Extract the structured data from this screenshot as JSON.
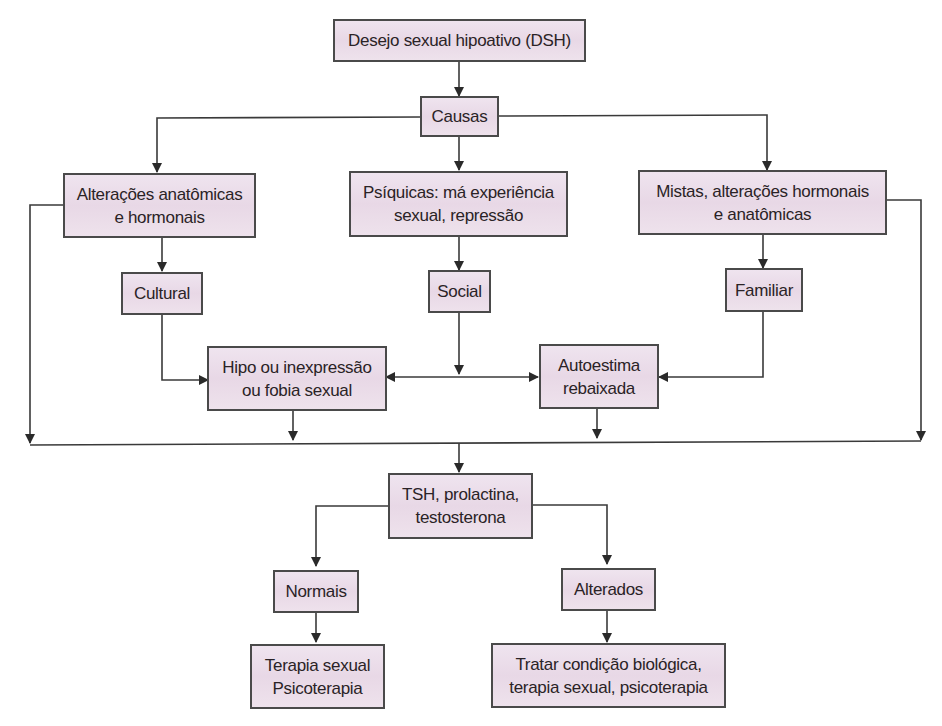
{
  "diagram": {
    "title": "Desejo sexual hipoativo (DSH)",
    "colors": {
      "node_fill": "#ebdde9",
      "node_border": "#4a4a4a",
      "edge": "#3a3a3a",
      "text": "#2a2326"
    },
    "nodes": {
      "dsh": {
        "lines": [
          "Desejo sexual hipoativo (DSH)"
        ]
      },
      "causas": {
        "lines": [
          "Causas"
        ]
      },
      "anatomicas": {
        "lines": [
          "Alterações anatômicas",
          "e hormonais"
        ]
      },
      "psiquicas": {
        "lines": [
          "Psíquicas: má experiência",
          "sexual, repressão"
        ]
      },
      "mistas": {
        "lines": [
          "Mistas, alterações hormonais",
          "e anatômicas"
        ]
      },
      "cultural": {
        "lines": [
          "Cultural"
        ]
      },
      "social": {
        "lines": [
          "Social"
        ]
      },
      "familiar": {
        "lines": [
          "Familiar"
        ]
      },
      "hipo": {
        "lines": [
          "Hipo ou inexpressão",
          "ou fobia sexual"
        ]
      },
      "autoestima": {
        "lines": [
          "Autoestima",
          "rebaixada"
        ]
      },
      "exames": {
        "lines": [
          "TSH, prolactina,",
          "testosterona"
        ]
      },
      "normais": {
        "lines": [
          "Normais"
        ]
      },
      "alterados": {
        "lines": [
          "Alterados"
        ]
      },
      "terapia": {
        "lines": [
          "Terapia sexual",
          "Psicoterapia"
        ]
      },
      "tratar": {
        "lines": [
          "Tratar condição biológica,",
          "terapia sexual, psicoterapia"
        ]
      }
    },
    "edges": [
      {
        "from": "dsh",
        "to": "causas"
      },
      {
        "from": "causas",
        "to": "anatomicas"
      },
      {
        "from": "causas",
        "to": "psiquicas"
      },
      {
        "from": "causas",
        "to": "mistas"
      },
      {
        "from": "anatomicas",
        "to": "cultural"
      },
      {
        "from": "psiquicas",
        "to": "social"
      },
      {
        "from": "mistas",
        "to": "familiar"
      },
      {
        "from": "cultural",
        "to": "hipo"
      },
      {
        "from": "social",
        "to": "hipo"
      },
      {
        "from": "social",
        "to": "autoestima"
      },
      {
        "from": "familiar",
        "to": "autoestima"
      },
      {
        "from": "anatomicas",
        "to": "exames"
      },
      {
        "from": "mistas",
        "to": "exames"
      },
      {
        "from": "hipo",
        "to": "exames"
      },
      {
        "from": "autoestima",
        "to": "exames"
      },
      {
        "from": "exames",
        "to": "normais"
      },
      {
        "from": "exames",
        "to": "alterados"
      },
      {
        "from": "normais",
        "to": "terapia"
      },
      {
        "from": "alterados",
        "to": "tratar"
      }
    ]
  }
}
